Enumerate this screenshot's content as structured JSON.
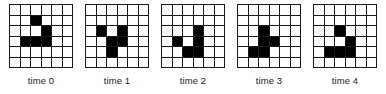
{
  "figure": {
    "title": "",
    "grid_rows": 6,
    "grid_cols": 6,
    "cell_on_color": "#000000",
    "cell_off_color": "#ffffff",
    "grid_line_color": "#1a1a1a",
    "background_color": "#ffffff"
  },
  "chart_data": {
    "type": "heatmap",
    "title": "",
    "subtitle": "",
    "xlabel": "",
    "ylabel": "",
    "grid": true,
    "legend_position": "none",
    "rows": 6,
    "cols": 6,
    "annotations": [],
    "frames": [
      {
        "label": "time 0",
        "live_cells": [
          [
            1,
            2
          ],
          [
            2,
            3
          ],
          [
            3,
            1
          ],
          [
            3,
            2
          ],
          [
            3,
            3
          ]
        ],
        "matrix": [
          [
            0,
            0,
            0,
            0,
            0,
            0
          ],
          [
            0,
            0,
            1,
            0,
            0,
            0
          ],
          [
            0,
            0,
            0,
            1,
            0,
            0
          ],
          [
            0,
            1,
            1,
            1,
            0,
            0
          ],
          [
            0,
            0,
            0,
            0,
            0,
            0
          ],
          [
            0,
            0,
            0,
            0,
            0,
            0
          ]
        ]
      },
      {
        "label": "time 1",
        "live_cells": [
          [
            2,
            1
          ],
          [
            2,
            3
          ],
          [
            3,
            2
          ],
          [
            3,
            3
          ],
          [
            4,
            2
          ]
        ],
        "matrix": [
          [
            0,
            0,
            0,
            0,
            0,
            0
          ],
          [
            0,
            0,
            0,
            0,
            0,
            0
          ],
          [
            0,
            1,
            0,
            1,
            0,
            0
          ],
          [
            0,
            0,
            1,
            1,
            0,
            0
          ],
          [
            0,
            0,
            1,
            0,
            0,
            0
          ],
          [
            0,
            0,
            0,
            0,
            0,
            0
          ]
        ]
      },
      {
        "label": "time 2",
        "live_cells": [
          [
            2,
            3
          ],
          [
            3,
            1
          ],
          [
            3,
            3
          ],
          [
            4,
            2
          ],
          [
            4,
            3
          ]
        ],
        "matrix": [
          [
            0,
            0,
            0,
            0,
            0,
            0
          ],
          [
            0,
            0,
            0,
            0,
            0,
            0
          ],
          [
            0,
            0,
            0,
            1,
            0,
            0
          ],
          [
            0,
            1,
            0,
            1,
            0,
            0
          ],
          [
            0,
            0,
            1,
            1,
            0,
            0
          ],
          [
            0,
            0,
            0,
            0,
            0,
            0
          ]
        ]
      },
      {
        "label": "time 3",
        "live_cells": [
          [
            2,
            2
          ],
          [
            3,
            2
          ],
          [
            3,
            3
          ],
          [
            4,
            1
          ],
          [
            4,
            2
          ]
        ],
        "matrix": [
          [
            0,
            0,
            0,
            0,
            0,
            0
          ],
          [
            0,
            0,
            0,
            0,
            0,
            0
          ],
          [
            0,
            0,
            1,
            0,
            0,
            0
          ],
          [
            0,
            0,
            1,
            1,
            0,
            0
          ],
          [
            0,
            1,
            1,
            0,
            0,
            0
          ],
          [
            0,
            0,
            0,
            0,
            0,
            0
          ]
        ]
      },
      {
        "label": "time 4",
        "live_cells": [
          [
            2,
            2
          ],
          [
            3,
            3
          ],
          [
            4,
            1
          ],
          [
            4,
            2
          ],
          [
            4,
            3
          ]
        ],
        "matrix": [
          [
            0,
            0,
            0,
            0,
            0,
            0
          ],
          [
            0,
            0,
            0,
            0,
            0,
            0
          ],
          [
            0,
            0,
            1,
            0,
            0,
            0
          ],
          [
            0,
            0,
            0,
            1,
            0,
            0
          ],
          [
            0,
            1,
            1,
            1,
            0,
            0
          ],
          [
            0,
            0,
            0,
            0,
            0,
            0
          ]
        ]
      }
    ]
  }
}
